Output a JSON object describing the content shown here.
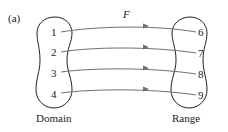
{
  "figure_label": "(a)",
  "function_name": "F",
  "domain": {
    "label": "Domain",
    "values": [
      "1",
      "2",
      "3",
      "4"
    ]
  },
  "range": {
    "label": "Range",
    "values": [
      "6",
      "7",
      "8",
      "9"
    ]
  },
  "mappings": [
    {
      "from": "1",
      "to": "6"
    },
    {
      "from": "2",
      "to": "7"
    },
    {
      "from": "3",
      "to": "8"
    },
    {
      "from": "4",
      "to": "9"
    }
  ],
  "colors": {
    "outline": "#222222",
    "arrow": "#707070",
    "text": "#222222"
  }
}
